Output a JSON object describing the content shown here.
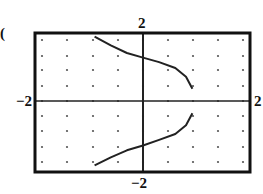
{
  "marker": "(",
  "chart_data": {
    "type": "line",
    "title": "",
    "xlabel": "",
    "ylabel": "",
    "xlim": [
      -2,
      2
    ],
    "ylim": [
      -2,
      2
    ],
    "tick_labels": {
      "x_min": "−2",
      "x_max": "2",
      "y_min": "−2",
      "y_max": "2"
    },
    "grid": "dots every 0.5 units",
    "grid_step": 0.5,
    "series": [
      {
        "name": "upper branch",
        "x": [
          -0.9,
          -0.6,
          -0.3,
          0.0,
          0.3,
          0.6,
          0.8,
          0.92
        ],
        "y": [
          1.85,
          1.6,
          1.38,
          1.25,
          1.12,
          0.95,
          0.7,
          0.35
        ]
      },
      {
        "name": "lower branch",
        "x": [
          0.92,
          0.8,
          0.6,
          0.3,
          0.0,
          -0.3,
          -0.6,
          -0.9
        ],
        "y": [
          -0.35,
          -0.7,
          -0.95,
          -1.12,
          -1.28,
          -1.42,
          -1.62,
          -1.85
        ]
      }
    ],
    "colors": {
      "frame": "#111111",
      "curve": "#222222",
      "dots": "#555555",
      "background": "#ffffff"
    }
  }
}
